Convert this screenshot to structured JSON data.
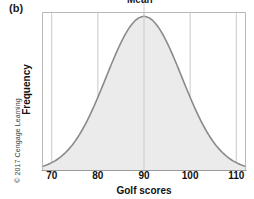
{
  "figure": {
    "panel_label": "(b)",
    "credit": "© 2017 Cengage Learning"
  },
  "colors": {
    "curve_stroke": "#8a8a8a",
    "curve_fill": "#ebebeb",
    "grid": "#c9c9c9",
    "frame": "#b8b8b8",
    "axis": "#9a9a9a",
    "text": "#111111"
  },
  "chart_data": {
    "type": "area",
    "title": "Mean",
    "xlabel": "Golf scores",
    "ylabel": "Frequency",
    "xlim": [
      68,
      112
    ],
    "ylim": [
      0,
      1
    ],
    "xticks": [
      70,
      80,
      90,
      100,
      110
    ],
    "xtick_labels": [
      "70",
      "80",
      "90",
      "100",
      "110"
    ],
    "yticks": [],
    "ytick_labels": [],
    "grid": true,
    "grid_axis": "x",
    "legend": null,
    "annotations": [
      {
        "text": "Mean",
        "x": 90,
        "note": "label sits above the plot, clipped by the top image edge, with a vertical line dropping to the curve"
      }
    ],
    "distribution": {
      "shape": "normal",
      "mean": 90,
      "std": 8.2,
      "peak_y": 1.0
    },
    "x": [
      68,
      70,
      72,
      74,
      76,
      78,
      80,
      82,
      84,
      86,
      88,
      90,
      92,
      94,
      96,
      98,
      100,
      102,
      104,
      106,
      108,
      110,
      112
    ],
    "y": [
      0.01,
      0.023,
      0.048,
      0.091,
      0.159,
      0.255,
      0.377,
      0.512,
      0.674,
      0.826,
      0.951,
      1.0,
      0.951,
      0.826,
      0.674,
      0.512,
      0.377,
      0.255,
      0.159,
      0.091,
      0.048,
      0.023,
      0.01
    ]
  }
}
